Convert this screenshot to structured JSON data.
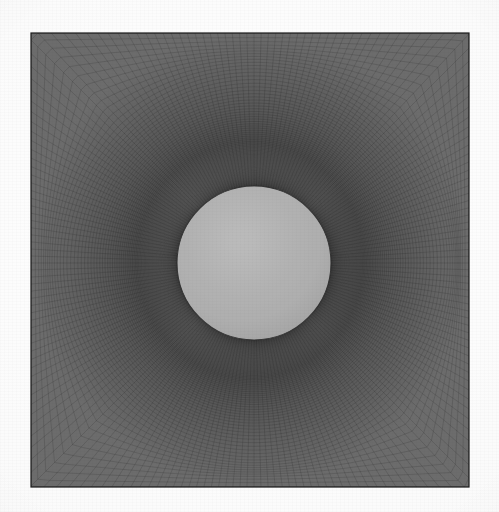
{
  "figure": {
    "kind": "computational-mesh-figure",
    "background_color": "#fbfbfb"
  },
  "chart_data": {
    "type": "mesh",
    "subtitle": "",
    "xlabel": "",
    "ylabel": "",
    "grid": true,
    "legend": false,
    "domain": {
      "shape": "square",
      "left_px": 31,
      "top_px": 33,
      "right_px": 469,
      "bottom_px": 487,
      "width_px": 438,
      "height_px": 454,
      "border_color": "#1a1a1a",
      "border_width_px": 1.2
    },
    "hole": {
      "shape": "circle",
      "label": "cylinder",
      "center_x_px": 254,
      "center_y_px": 263,
      "radius_px": 77,
      "fill_color": "#b4b4b4",
      "edge_color": "#2b2b2b"
    },
    "grid_spec": {
      "topology": "O-grid / body-fitted structured",
      "radial_divisions": 104,
      "circumferential_divisions": 200,
      "radial_growth_ratio": 1.034,
      "first_cell_height_px": 0.55,
      "cartesian_blend": "outer 35% of radial extent blends to square far-field",
      "line_color": "#2e2e2e",
      "line_width_px": 0.28,
      "line_opacity": 0.72
    },
    "color_scale": {
      "mesh_dark": "#2b2b2b",
      "field_dark": "#3a3a3a",
      "hole_light": "#b4b4b4",
      "paper": "#fbfbfb"
    },
    "annotations": []
  }
}
